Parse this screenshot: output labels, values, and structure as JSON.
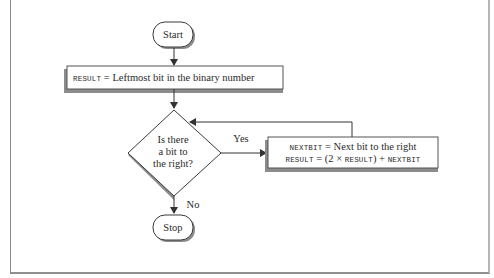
{
  "flowchart": {
    "start": {
      "label": "Start"
    },
    "init_step": {
      "code": "RESULT",
      "text": " = Leftmost bit in the binary number"
    },
    "decision": {
      "lines": [
        "Is there",
        "a bit to",
        "the right?"
      ]
    },
    "yes_label": "Yes",
    "no_label": "No",
    "loop_step": {
      "line1_code": "NEXTBIT",
      "line1_text": " = Next bit to the right",
      "line2_code_a": "RESULT",
      "line2_text_a": " = (2 × ",
      "line2_code_b": "RESULT",
      "line2_text_b": ") + ",
      "line2_code_c": "NEXTBIT"
    },
    "stop": {
      "label": "Stop"
    }
  },
  "colors": {
    "stroke": "#3a3a3a",
    "shadow": "#8c8c8c",
    "fill": "#ffffff"
  }
}
